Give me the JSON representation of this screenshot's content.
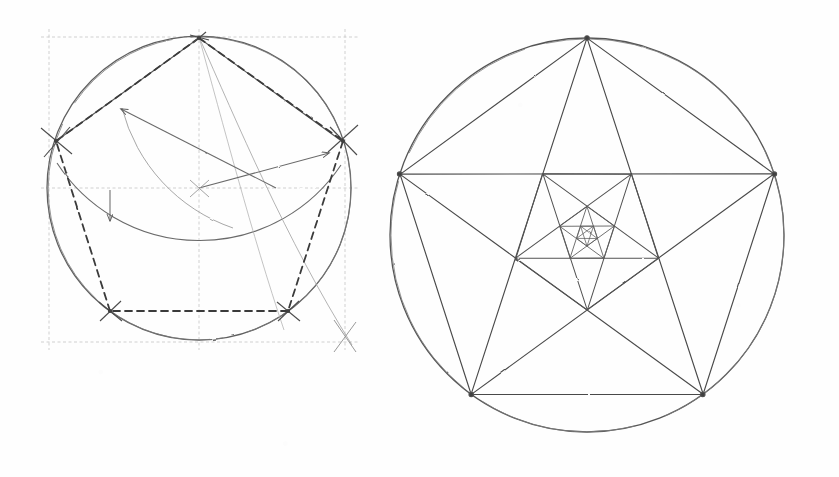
{
  "document": {
    "title": "Geometric construction of the regular pentagon",
    "kind": "hand-drawn pencil diagram",
    "background_color": "#fefefe",
    "width": 839,
    "height": 477
  },
  "style": {
    "ink_dark": "#4a4a4a",
    "ink_mid": "#6d6d6d",
    "ink_light": "#9a9a9a",
    "ink_faint": "#b8b8b8",
    "construction_color": "#a8a8a8",
    "dashed_color": "#3f3f3f"
  },
  "figures": [
    {
      "id": "left-figure",
      "name": "pentagon-construction",
      "caption": "Compass-and-straightedge construction of a regular pentagon",
      "circle": {
        "cx": 199,
        "cy": 188,
        "r": 152
      },
      "bounding_box": {
        "x": 49,
        "y": 37,
        "width": 296,
        "height": 305
      },
      "center_point": {
        "x": 199,
        "y": 188
      },
      "pentagon_vertices": [
        {
          "name": "top",
          "x": 199,
          "y": 37
        },
        {
          "name": "upper-right",
          "x": 343,
          "y": 141
        },
        {
          "name": "lower-right",
          "x": 288,
          "y": 311
        },
        {
          "name": "lower-left",
          "x": 110,
          "y": 311
        },
        {
          "name": "upper-left",
          "x": 55,
          "y": 141
        }
      ],
      "midpoint_marks": [
        {
          "name": "left-radius-midpoint",
          "x": 124,
          "y": 188
        },
        {
          "name": "right-chord-point",
          "x": 276,
          "y": 188
        }
      ],
      "construction_arcs": [
        {
          "name": "arc-from-left-midpoint",
          "cx": 124,
          "cy": 188,
          "r": 164,
          "from_deg": 268,
          "to_deg": 332
        },
        {
          "name": "arc-radius-transfer",
          "cx": 199,
          "cy": 37,
          "r": 175,
          "from_deg": 40,
          "to_deg": 140
        }
      ],
      "arrows": [
        {
          "name": "arrow-to-upper-left-arc",
          "x1": 276,
          "y1": 188,
          "x2": 120,
          "y2": 108,
          "head": "end"
        },
        {
          "name": "arrow-to-upper-right",
          "x1": 199,
          "y1": 188,
          "x2": 330,
          "y2": 152,
          "head": "end"
        },
        {
          "name": "arrow-down-left",
          "x1": 110,
          "y1": 188,
          "x2": 110,
          "y2": 222,
          "head": "end"
        }
      ],
      "dashed_polygon": "pentagon",
      "tick_crosses": 6,
      "grid_lines": [
        "top",
        "bottom",
        "left",
        "right",
        "horizontal-center",
        "vertical-center"
      ]
    },
    {
      "id": "right-figure",
      "name": "nested-pentagram",
      "caption": "Circumscribed circle with inscribed pentagon and recursively nested pentagrams",
      "circle": {
        "cx": 587,
        "cy": 235,
        "r": 197
      },
      "pentagon_vertices": [
        {
          "name": "top",
          "x": 587,
          "y": 38
        },
        {
          "name": "right",
          "x": 774,
          "y": 185
        },
        {
          "name": "lower-right",
          "x": 703,
          "y": 405
        },
        {
          "name": "lower-left",
          "x": 471,
          "y": 405
        },
        {
          "name": "left",
          "x": 400,
          "y": 185
        }
      ],
      "nesting_levels": 4,
      "draws_pentagram_per_level": true,
      "draws_pentagon_per_level": true
    }
  ]
}
